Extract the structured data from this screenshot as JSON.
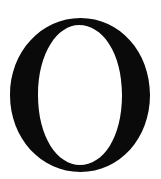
{
  "glyph": {
    "character": "O",
    "style": "serif",
    "color": "#0a0a0a",
    "background": "#ffffff"
  }
}
